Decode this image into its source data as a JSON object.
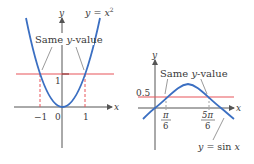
{
  "left_graph": {
    "y_axis_label": "y",
    "x_axis_label": "x",
    "curve_label": "y = x",
    "curve_label_exponent": "2",
    "annotation": "Same y-value",
    "ticks_x": [
      "−1",
      "0",
      "1"
    ],
    "tick_y": "1"
  },
  "right_graph": {
    "y_axis_label": "y",
    "x_axis_label": "x",
    "curve_label": "y = sin x",
    "annotation": "Same y-value",
    "tick_y": "0.5",
    "tick_x1_num": "π",
    "tick_x1_den": "6",
    "tick_x2_num": "5π",
    "tick_x2_den": "6"
  },
  "colors": {
    "curve": "#3b6fc2",
    "horizontal_line": "#e8555a",
    "dashed": "#e8555a",
    "axis": "#555555"
  }
}
